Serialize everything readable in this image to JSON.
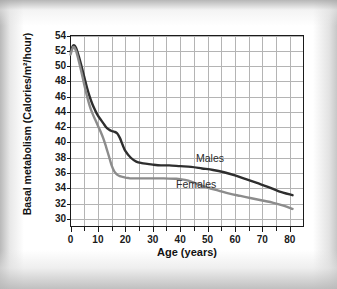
{
  "figure": {
    "background_color": "#ffffff",
    "frame_color": "#1a1a1a",
    "grid_color": "#b4b4b4"
  },
  "chart_data": {
    "type": "line",
    "title": "",
    "xlabel": "Age (years)",
    "ylabel": "Basal metabolism (Calories/m²/hour)",
    "xlim": [
      0,
      85
    ],
    "ylim": [
      29,
      54
    ],
    "xticks": [
      0,
      10,
      20,
      30,
      40,
      50,
      60,
      70,
      80
    ],
    "xtick_labels": [
      "0",
      "10",
      "20",
      "30",
      "40",
      "50",
      "60",
      "70",
      "80"
    ],
    "x_minor_tick_step": 5,
    "yticks": [
      30,
      32,
      34,
      36,
      38,
      40,
      42,
      44,
      46,
      48,
      50,
      52,
      54
    ],
    "ytick_labels": [
      "30",
      "32",
      "34",
      "36",
      "38",
      "40",
      "42",
      "44",
      "46",
      "48",
      "50",
      "52",
      "54"
    ],
    "grid": true,
    "grid_x_step": 5,
    "grid_y_step": 2,
    "legend_position": "inline-annotations",
    "annotations": [
      {
        "text": "Males",
        "x": 50,
        "y": 38.0
      },
      {
        "text": "Females",
        "x": 41,
        "y": 34.3
      }
    ],
    "series": [
      {
        "name": "Males",
        "color": "#2e2e2e",
        "line_width": 2.4,
        "x": [
          0,
          1,
          2,
          3,
          4,
          5,
          6,
          7,
          8,
          9,
          10,
          11,
          12,
          13,
          14,
          15,
          16,
          17,
          18,
          19,
          20,
          22,
          24,
          26,
          28,
          30,
          33,
          36,
          40,
          44,
          48,
          52,
          56,
          60,
          64,
          68,
          72,
          76,
          81
        ],
        "values": [
          51.9,
          52.7,
          52.4,
          51.3,
          50.0,
          48.6,
          47.2,
          46.0,
          45.0,
          44.2,
          43.5,
          43.0,
          42.5,
          42.0,
          41.7,
          41.5,
          41.4,
          41.2,
          40.6,
          39.7,
          38.9,
          38.0,
          37.5,
          37.3,
          37.2,
          37.1,
          37.0,
          37.0,
          36.9,
          36.8,
          36.6,
          36.4,
          36.1,
          35.7,
          35.2,
          34.7,
          34.2,
          33.6,
          33.1
        ]
      },
      {
        "name": "Females",
        "color": "#8c8c8c",
        "line_width": 2.4,
        "x": [
          0,
          1,
          2,
          3,
          4,
          5,
          6,
          7,
          8,
          9,
          10,
          11,
          12,
          13,
          14,
          15,
          16,
          17,
          18,
          19,
          20,
          21,
          22,
          24,
          26,
          28,
          30,
          34,
          38,
          40,
          43,
          46,
          50,
          54,
          58,
          62,
          66,
          70,
          74,
          78,
          81
        ],
        "values": [
          51.5,
          52.5,
          52.0,
          50.7,
          49.2,
          47.6,
          46.1,
          44.8,
          43.8,
          43.0,
          42.2,
          41.4,
          40.5,
          39.4,
          38.2,
          37.0,
          36.2,
          35.8,
          35.6,
          35.5,
          35.4,
          35.35,
          35.3,
          35.3,
          35.3,
          35.3,
          35.3,
          35.3,
          35.25,
          35.2,
          35.0,
          34.6,
          34.1,
          33.7,
          33.3,
          33.0,
          32.7,
          32.4,
          32.1,
          31.7,
          31.3
        ]
      }
    ]
  }
}
